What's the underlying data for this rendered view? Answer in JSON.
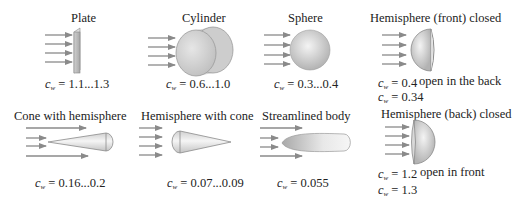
{
  "symbol": {
    "base": "c",
    "sub": "w"
  },
  "bodies": [
    {
      "name": "Plate",
      "cw": [
        "= 1.1...1.3"
      ]
    },
    {
      "name": "Cylinder",
      "cw": [
        "= 0.6...1.0"
      ]
    },
    {
      "name": "Sphere",
      "cw": [
        "= 0.3...0.4"
      ]
    },
    {
      "name": "Hemisphere (front) closed",
      "cw": [
        "= 0.4",
        "= 0.34"
      ],
      "note": "open in the back"
    },
    {
      "name": "Cone with hemisphere",
      "cw": [
        "= 0.16...0.2"
      ]
    },
    {
      "name": "Hemisphere with cone",
      "cw": [
        "= 0.07...0.09"
      ]
    },
    {
      "name": "Streamlined body",
      "cw": [
        "= 0.055"
      ]
    },
    {
      "name": "Hemisphere (back) closed",
      "cw": [
        "= 1.2",
        "= 1.3"
      ],
      "note": "open in front"
    }
  ],
  "colors": {
    "arrow": "#8a8a8a",
    "body_light": "#f2f2f2",
    "body_dark": "#b5b5b5",
    "outline": "#7a7a7a"
  }
}
